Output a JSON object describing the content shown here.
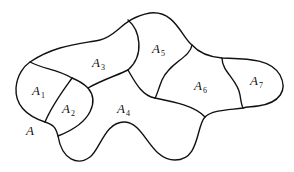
{
  "diagram": {
    "stroke_color": "#111111",
    "background": "#ffffff",
    "labels": [
      {
        "id": "A",
        "base": "A",
        "sub": "",
        "x": 26,
        "y": 124
      },
      {
        "id": "A1",
        "base": "A",
        "sub": "1",
        "x": 32,
        "y": 84
      },
      {
        "id": "A2",
        "base": "A",
        "sub": "2",
        "x": 62,
        "y": 102
      },
      {
        "id": "A3",
        "base": "A",
        "sub": "3",
        "x": 92,
        "y": 56
      },
      {
        "id": "A4",
        "base": "A",
        "sub": "4",
        "x": 117,
        "y": 102
      },
      {
        "id": "A5",
        "base": "A",
        "sub": "5",
        "x": 152,
        "y": 42
      },
      {
        "id": "A6",
        "base": "A",
        "sub": "6",
        "x": 194,
        "y": 79
      },
      {
        "id": "A7",
        "base": "A",
        "sub": "7",
        "x": 250,
        "y": 74
      }
    ]
  }
}
